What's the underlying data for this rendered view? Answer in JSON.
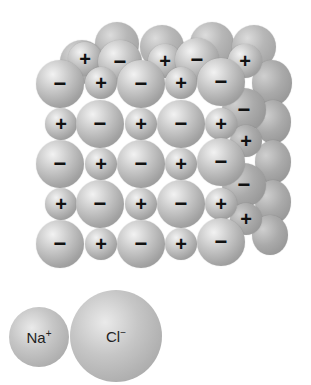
{
  "diagram": {
    "ion_symbols": {
      "cation": "+",
      "anion": "−"
    },
    "front_face": {
      "rows": [
        [
          "−",
          "+",
          "−",
          "+",
          "−"
        ],
        [
          "+",
          "−",
          "+",
          "−",
          "+"
        ],
        [
          "−",
          "+",
          "−",
          "+",
          "−"
        ],
        [
          "+",
          "−",
          "+",
          "−",
          "+"
        ],
        [
          "−",
          "+",
          "−",
          "+",
          "−"
        ]
      ]
    },
    "top_face_visible_labels": [
      "+",
      "−",
      "+",
      "−",
      "+"
    ],
    "side_face_visible_labels": [
      "+",
      "−",
      "+",
      "−",
      "+"
    ]
  },
  "legend": {
    "sodium": {
      "symbol": "Na",
      "charge": "+"
    },
    "chloride": {
      "symbol": "Cl",
      "charge": "−"
    }
  },
  "colors": {
    "sphere_light": "#f2f2f2",
    "sphere_mid": "#c9c9c9",
    "sphere_dark": "#8a8a8a",
    "label": "#111111"
  }
}
